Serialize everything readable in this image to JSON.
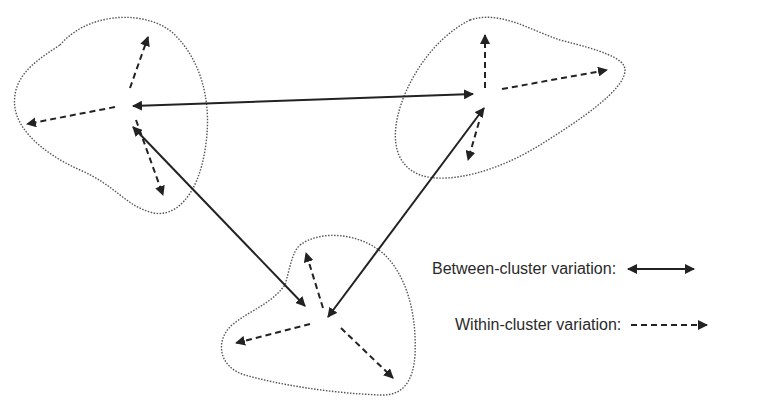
{
  "diagram": {
    "colors": {
      "ink": "#222222",
      "outline": "#555555",
      "text": "#2a2a2a"
    },
    "clusters": [
      {
        "name": "cluster-left",
        "center": [
          130,
          105
        ],
        "within_targets": [
          [
            148,
            37
          ],
          [
            27,
            124
          ],
          [
            163,
            195
          ]
        ]
      },
      {
        "name": "cluster-right",
        "center": [
          485,
          95
        ],
        "within_targets": [
          [
            485,
            35
          ],
          [
            607,
            70
          ],
          [
            468,
            160
          ]
        ]
      },
      {
        "name": "cluster-bottom",
        "center": [
          327,
          320
        ],
        "within_targets": [
          [
            306,
            253
          ],
          [
            236,
            343
          ],
          [
            393,
            378
          ]
        ]
      }
    ],
    "between_links": [
      {
        "from": "cluster-left",
        "to": "cluster-right"
      },
      {
        "from": "cluster-left",
        "to": "cluster-bottom"
      },
      {
        "from": "cluster-right",
        "to": "cluster-bottom"
      }
    ]
  },
  "legend": {
    "between_label": "Between-cluster variation:",
    "within_label": "Within-cluster variation:"
  }
}
